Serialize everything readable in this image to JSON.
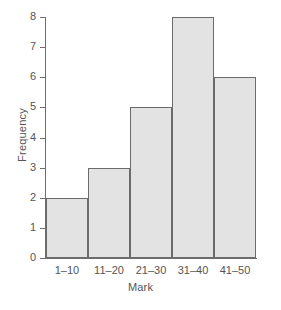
{
  "chart_data": {
    "type": "bar",
    "title": "",
    "subtitle": "",
    "xlabel": "Mark",
    "ylabel": "Frequency",
    "categories": [
      "1–10",
      "11–20",
      "21–30",
      "31–40",
      "41–50"
    ],
    "values": [
      2,
      3,
      5,
      8,
      6
    ],
    "series": [
      {
        "name": "Frequency",
        "values": [
          2,
          3,
          5,
          8,
          6
        ]
      }
    ],
    "ylim": [
      0,
      8
    ],
    "yticks": [
      0,
      1,
      2,
      3,
      4,
      5,
      6,
      7,
      8
    ],
    "ytick_labels": [
      "0",
      "1",
      "2",
      "3",
      "4",
      "5",
      "6",
      "7",
      "8"
    ],
    "grid": false,
    "legend": "none",
    "annotations": [],
    "colors": {
      "bar_fill": "#e3e3e3",
      "bar_border": "#6b6b6b",
      "axis": "#6e6e6e",
      "text": "#555555",
      "background": "#ffffff"
    }
  }
}
